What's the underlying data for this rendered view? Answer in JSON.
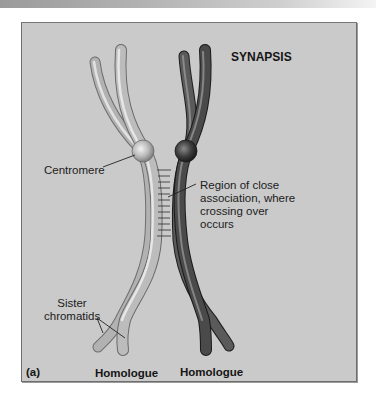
{
  "figure": {
    "panel_label": "(a)",
    "title": "SYNAPSIS",
    "labels": {
      "centromere": "Centromere",
      "region_line1": "Region of close",
      "region_line2": "association, where",
      "region_line3": "crossing over",
      "region_line4": "occurs",
      "sister_line1": "Sister",
      "sister_line2": "chromatids"
    },
    "homologues": [
      {
        "label": "Homologue",
        "shade": "light",
        "color": "#b9b9b9"
      },
      {
        "label": "Homologue",
        "shade": "dark",
        "color": "#4a4a4a"
      }
    ],
    "colors": {
      "panel_background": "#cacaca",
      "frame_border": "#6e6e6e",
      "light_chromosome": "#b9b9b9",
      "dark_chromosome": "#4a4a4a",
      "text": "#1c1c1c"
    }
  }
}
